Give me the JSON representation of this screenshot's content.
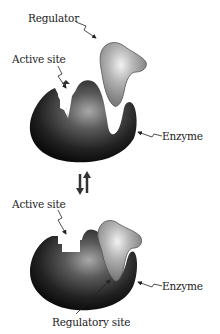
{
  "diagram": {
    "type": "allosteric-enzyme-regulation",
    "top_panel": {
      "labels": {
        "regulator": "Regulator",
        "active_site": "Active site",
        "enzyme": "Enzyme"
      },
      "state": "regulator unbound, active site open (jagged)"
    },
    "transition": {
      "symbol": "⇃↾",
      "meaning": "reversible equilibrium"
    },
    "bottom_panel": {
      "labels": {
        "active_site": "Active site",
        "enzyme": "Enzyme",
        "regulatory_site": "Regulatory site"
      },
      "state": "regulator bound at regulatory site, active site shape changed (rectangular)"
    },
    "colors": {
      "enzyme_dark": "#111111",
      "enzyme_highlight": "#9a9a9a",
      "regulator_fill": "#888888",
      "regulator_highlight": "#e6e6e6",
      "text": "#222222"
    }
  }
}
